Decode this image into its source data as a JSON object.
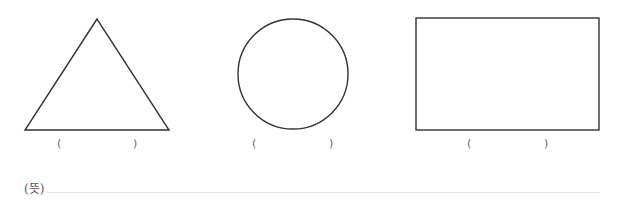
{
  "shapes": [
    {
      "name": "triangle",
      "open_paren": "(",
      "close_paren": ")",
      "answer": ""
    },
    {
      "name": "circle",
      "open_paren": "(",
      "close_paren": ")",
      "answer": ""
    },
    {
      "name": "rectangle",
      "open_paren": "(",
      "close_paren": ")",
      "answer": ""
    }
  ],
  "meaning": {
    "label": "(뜻)",
    "answer": ""
  },
  "colors": {
    "stroke": "#333333",
    "line": "#e4e4e4"
  }
}
